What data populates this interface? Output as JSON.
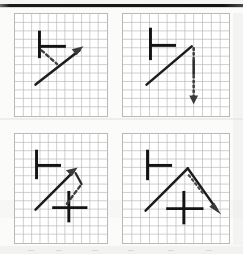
{
  "figure": {
    "panel_count": 4,
    "background_color": "#fbfbfa",
    "grid_line_color": "#b9b9b9",
    "stroke_color": "#141414",
    "arrow_color": "#3a3a3a",
    "top_rule_color": "#141414"
  },
  "panels": [
    {
      "id": "panel-top-left",
      "position": "top-left",
      "grid": {
        "cols": 11,
        "rows": 12,
        "cell_px": 8.5
      },
      "glyph": {
        "name": "right-tack-glyph",
        "strokes": [
          {
            "type": "vertical-bar",
            "label": "stroke-1"
          },
          {
            "type": "horizontal-bar",
            "label": "stroke-2"
          }
        ]
      },
      "arrows": [
        {
          "name": "solid-diagonal-up-right-arrow",
          "style": "solid",
          "direction": "up-right",
          "head": true
        },
        {
          "name": "dashed-connector-arrow",
          "style": "dashed",
          "direction": "down-right",
          "head": false
        }
      ]
    },
    {
      "id": "panel-top-right",
      "position": "top-right",
      "grid": {
        "cols": 12,
        "rows": 12,
        "cell_px": 8.5
      },
      "glyph": {
        "name": "right-tack-glyph",
        "strokes": [
          {
            "type": "vertical-bar",
            "label": "stroke-1"
          },
          {
            "type": "horizontal-bar",
            "label": "stroke-2"
          }
        ]
      },
      "arrows": [
        {
          "name": "solid-diagonal-up-right-arrow",
          "style": "solid",
          "direction": "up-right",
          "head": false
        },
        {
          "name": "dotted-vertical-down-arrow",
          "style": "dotted",
          "direction": "down",
          "head": true
        }
      ]
    },
    {
      "id": "panel-bottom-left",
      "position": "bottom-left",
      "grid": {
        "cols": 11,
        "rows": 13,
        "cell_px": 8.5
      },
      "glyph": {
        "name": "right-tack-glyph",
        "strokes": [
          {
            "type": "vertical-bar",
            "label": "stroke-1"
          },
          {
            "type": "horizontal-bar",
            "label": "stroke-2"
          }
        ]
      },
      "secondary_glyph": {
        "name": "plus-cross-glyph",
        "strokes": [
          {
            "type": "vertical-bar",
            "label": "stroke-1"
          },
          {
            "type": "horizontal-bar",
            "label": "stroke-2"
          }
        ]
      },
      "arrows": [
        {
          "name": "solid-diagonal-up-right-arrow",
          "style": "solid",
          "direction": "up-right",
          "head": true
        },
        {
          "name": "dashed-diagonal-up-left-arrow",
          "style": "dashed",
          "direction": "up-left",
          "head": false
        }
      ]
    },
    {
      "id": "panel-bottom-right",
      "position": "bottom-right",
      "grid": {
        "cols": 12,
        "rows": 13,
        "cell_px": 8.5
      },
      "glyph": {
        "name": "right-tack-glyph",
        "strokes": [
          {
            "type": "vertical-bar",
            "label": "stroke-1"
          },
          {
            "type": "horizontal-bar",
            "label": "stroke-2"
          }
        ]
      },
      "secondary_glyph": {
        "name": "plus-cross-glyph",
        "strokes": [
          {
            "type": "vertical-bar",
            "label": "stroke-1"
          },
          {
            "type": "horizontal-bar",
            "label": "stroke-2"
          }
        ]
      },
      "arrows": [
        {
          "name": "solid-chevron-peak-arrow",
          "style": "solid",
          "direction": "up-right-then-down-right",
          "head": true
        },
        {
          "name": "dotted-connector-arrow",
          "style": "dotted",
          "direction": "down-right",
          "head": false
        }
      ]
    }
  ]
}
